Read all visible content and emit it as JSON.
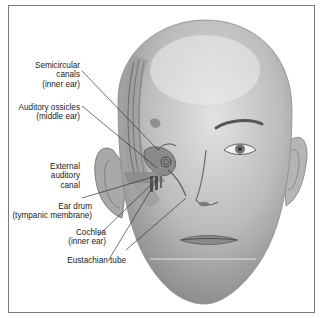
{
  "figure": {
    "border_color": "#7a7a7a",
    "labels": [
      {
        "id": "semicircular-canals",
        "line1": "Semicircular",
        "line2": "canals",
        "line3": "(inner ear)"
      },
      {
        "id": "auditory-ossicles",
        "line1": "Auditory ossicles",
        "line2": "(middle ear)"
      },
      {
        "id": "external-auditory-canal",
        "line1": "External",
        "line2": "auditory",
        "line3": "canal"
      },
      {
        "id": "ear-drum",
        "line1": "Ear drum",
        "line2": "(tympanic membrane)"
      },
      {
        "id": "cochlea",
        "line1": "Cochlea",
        "line2": "(inner ear)"
      },
      {
        "id": "eustachian-tube",
        "line1": "Eustachian tube"
      }
    ]
  }
}
